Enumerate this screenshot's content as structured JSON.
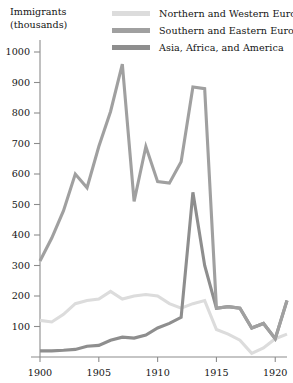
{
  "axis_title": {
    "line1": "Immigrants",
    "line2": "(thousands)"
  },
  "legend": {
    "items": [
      {
        "label": "Northern and Western Europe",
        "color": "#dcdcdc",
        "swatch_name": "legend-swatch-northern-western-europe"
      },
      {
        "label": "Southern and Eastern Europe",
        "color": "#a0a0a0",
        "swatch_name": "legend-swatch-southern-eastern-europe"
      },
      {
        "label": "Asia, Africa, and America",
        "color": "#8e8e8e",
        "swatch_name": "legend-swatch-asia-africa-america"
      }
    ]
  },
  "chart_data": {
    "type": "line",
    "title": "",
    "subtitle": "",
    "xlabel": "",
    "ylabel": "Immigrants (thousands)",
    "xlim": [
      1900,
      1921
    ],
    "ylim": [
      0,
      1000
    ],
    "grid": false,
    "legend_position": "top-right",
    "yticks": [
      100,
      200,
      300,
      400,
      500,
      600,
      700,
      800,
      900,
      1000
    ],
    "ytick_labels": [
      "100",
      "200",
      "300",
      "400",
      "500",
      "600",
      "700",
      "800",
      "900",
      "1000"
    ],
    "xticks": [
      1900,
      1905,
      1910,
      1915,
      1920
    ],
    "xtick_labels": [
      "1900",
      "1905",
      "1910",
      "1915",
      "1920"
    ],
    "x": [
      1900,
      1901,
      1902,
      1903,
      1904,
      1905,
      1906,
      1907,
      1908,
      1909,
      1910,
      1911,
      1912,
      1913,
      1914,
      1915,
      1916,
      1917,
      1918,
      1919,
      1920,
      1921
    ],
    "series": [
      {
        "name": "Northern and Western Europe",
        "color": "#dcdcdc",
        "values": [
          120,
          115,
          140,
          175,
          185,
          190,
          215,
          190,
          200,
          205,
          200,
          175,
          160,
          175,
          185,
          90,
          75,
          55,
          12,
          30,
          60,
          75
        ]
      },
      {
        "name": "Southern and Eastern Europe",
        "color": "#a0a0a0",
        "values": [
          315,
          390,
          480,
          600,
          555,
          690,
          805,
          960,
          510,
          690,
          575,
          570,
          640,
          885,
          880,
          160,
          165,
          160,
          95,
          110,
          60,
          185
        ]
      },
      {
        "name": "Asia, Africa, and America",
        "color": "#8e8e8e",
        "values": [
          20,
          20,
          22,
          25,
          35,
          38,
          55,
          65,
          62,
          72,
          95,
          110,
          130,
          540,
          300,
          160,
          165,
          160,
          95,
          110,
          60,
          185
        ]
      }
    ]
  }
}
